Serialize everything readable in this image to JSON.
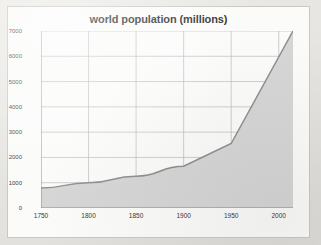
{
  "chart_data": {
    "type": "area",
    "title": "world population (millions)",
    "xlabel": "",
    "ylabel": "",
    "xlim": [
      1750,
      2015
    ],
    "ylim": [
      0,
      7000
    ],
    "grid": true,
    "legend": null,
    "x_ticks": [
      1750,
      1800,
      1850,
      1900,
      1950,
      2000
    ],
    "x_tick_labels": [
      "1750",
      "1800",
      "1850",
      "1900",
      "1950",
      "2000"
    ],
    "y_ticks": [
      0,
      1000,
      2000,
      3000,
      4000,
      5000,
      6000,
      7000
    ],
    "y_tick_labels": [
      "0",
      "1000",
      "2000",
      "3000",
      "4000",
      "5000",
      "6000",
      "7000"
    ],
    "series": [
      {
        "name": "world population",
        "x": [
          1750,
          1800,
          1850,
          1900,
          1950,
          2015
        ],
        "values": [
          790,
          1000,
          1260,
          1650,
          2550,
          7000
        ]
      }
    ],
    "colors": {
      "line": "#8f8f8f",
      "fill": "#d6d6d6",
      "grid": "#b9b9b9",
      "axis": "#8a8a8a",
      "title": "#2b2b2b",
      "card": "#fbfbfa",
      "page": "#e8e7e3"
    }
  }
}
